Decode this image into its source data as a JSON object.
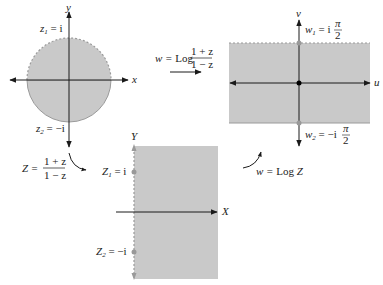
{
  "colors": {
    "region_fill": "#c9c9c9",
    "axis": "#1a1a1a",
    "dashed_boundary": "#9a9a9a",
    "point": "#999999",
    "origin_point": "#000000"
  },
  "z_plane": {
    "x_axis_label": "x",
    "y_axis_label": "y",
    "point1_label_main": "z",
    "point1_label_sub": "1",
    "point1_label_value": " = i",
    "point2_label_main": "z",
    "point2_label_sub": "2",
    "point2_label_value": " = −i"
  },
  "w_plane": {
    "u_axis_label": "u",
    "v_axis_label": "v",
    "point1_label_main": "w",
    "point1_label_sub": "1",
    "point1_label_value": " = i",
    "point1_label_num": "π",
    "point1_label_den": "2",
    "point2_label_main": "w",
    "point2_label_sub": "2",
    "point2_label_value": " = −i",
    "point2_label_num": "π",
    "point2_label_den": "2"
  },
  "Z_plane": {
    "X_axis_label": "X",
    "Y_axis_label": "Y",
    "point1_label_main": "Z",
    "point1_label_sub": "1",
    "point1_label_value": " = i",
    "point2_label_main": "Z",
    "point2_label_sub": "2",
    "point2_label_value": " = −i"
  },
  "mappings": {
    "top": {
      "lhs": "w = ",
      "func": "Log",
      "num": "1 + z",
      "den": "1 − z"
    },
    "left": {
      "lhs": "Z = ",
      "num": "1 + z",
      "den": "1 − z"
    },
    "right": {
      "lhs": "w = ",
      "func": "Log",
      "arg": " Z"
    }
  }
}
